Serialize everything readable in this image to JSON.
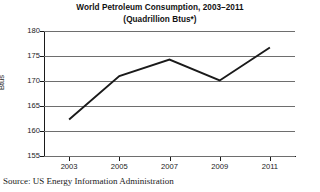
{
  "chart_data": {
    "type": "line",
    "title": "World Petroleum Consumption, 2003–2011",
    "subtitle": "(Quadrillion Btus*)",
    "xlabel": "",
    "ylabel": "Btus",
    "x": [
      2003,
      2005,
      2007,
      2009,
      2011
    ],
    "categories": [
      "2003",
      "2005",
      "2007",
      "2009",
      "2011"
    ],
    "values": [
      162.3,
      171.0,
      174.3,
      170.1,
      176.7
    ],
    "series": [
      {
        "name": "World Petroleum Consumption",
        "values": [
          162.3,
          171.0,
          174.3,
          170.1,
          176.7
        ]
      }
    ],
    "ylim": [
      155,
      180
    ],
    "xlim": [
      2002,
      2012
    ],
    "yticks": [
      155,
      160,
      165,
      170,
      175,
      180
    ],
    "ytick_labels": [
      "155",
      "160",
      "165",
      "170",
      "175",
      "180"
    ],
    "xticks": [
      2003,
      2005,
      2007,
      2009,
      2011
    ],
    "xtick_labels": [
      "2003",
      "2005",
      "2007",
      "2009",
      "2011"
    ],
    "grid": "horizontal",
    "legend": "none",
    "line_color": "#1a1a1a",
    "grid_color": "#6e6e6e",
    "axis_color": "#1a1a1a"
  },
  "footer": {
    "source": "Source: US Energy Information Administration"
  }
}
